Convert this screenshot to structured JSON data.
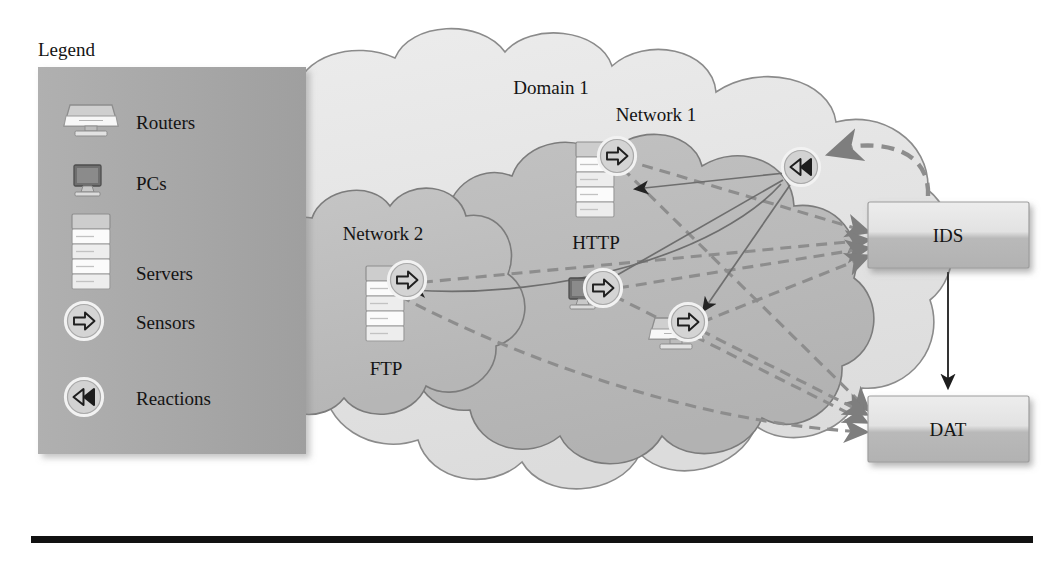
{
  "figure": {
    "background_color": "#ffffff",
    "rule_color": "#111111"
  },
  "legend": {
    "title": "Legend",
    "panel_color": "#a9a9a9",
    "items": [
      {
        "icon": "router-icon",
        "label": "Routers"
      },
      {
        "icon": "pc-icon",
        "label": "PCs"
      },
      {
        "icon": "server-icon",
        "label": "Servers"
      },
      {
        "icon": "sensor-icon",
        "label": "Sensors"
      },
      {
        "icon": "reaction-icon",
        "label": "Reactions"
      }
    ]
  },
  "clouds": [
    {
      "id": "domain1",
      "label": "Domain 1",
      "fill": "#e6e6e6",
      "stroke": "#8a8a8a"
    },
    {
      "id": "network1",
      "label": "Network 1",
      "fill": "#b9b9b9",
      "stroke": "#7d7d7d"
    },
    {
      "id": "network2",
      "label": "Network 2",
      "fill": "#bdbdbd",
      "stroke": "#7d7d7d"
    }
  ],
  "nodes": [
    {
      "id": "http",
      "label": "HTTP",
      "type": "server-icon",
      "sensor": true,
      "network": "Network 1"
    },
    {
      "id": "ftp",
      "label": "FTP",
      "type": "server-icon",
      "sensor": true,
      "network": "Network 2"
    },
    {
      "id": "pc1",
      "label": "",
      "type": "pc-icon",
      "sensor": true,
      "network": "Network 1"
    },
    {
      "id": "rtr1",
      "label": "",
      "type": "router-icon",
      "sensor": true,
      "network": "Network 1"
    },
    {
      "id": "rx1",
      "label": "",
      "type": "reaction-icon",
      "sensor": false,
      "network": "Network 1"
    }
  ],
  "boxes": [
    {
      "id": "ids",
      "label": "IDS",
      "fill_top": "#e9e9e9",
      "fill_bottom": "#b6b6b6",
      "stroke": "#9a9a9a"
    },
    {
      "id": "dat",
      "label": "DAT",
      "fill_top": "#e9e9e9",
      "fill_bottom": "#b6b6b6",
      "stroke": "#9a9a9a"
    }
  ],
  "edges": {
    "alert_style": "dashed",
    "alert_color": "#8d8d8d",
    "reaction_style": "solid",
    "reaction_color": "#6b6b6b",
    "ids_to_dat_color": "#2b2b2b",
    "alerts": [
      {
        "from": "http",
        "to": "ids"
      },
      {
        "from": "http",
        "to": "dat"
      },
      {
        "from": "ftp",
        "to": "ids"
      },
      {
        "from": "ftp",
        "to": "dat"
      },
      {
        "from": "pc1",
        "to": "ids"
      },
      {
        "from": "pc1",
        "to": "dat"
      },
      {
        "from": "rtr1",
        "to": "ids"
      },
      {
        "from": "rtr1",
        "to": "dat"
      },
      {
        "from": "ids",
        "to": "rx1"
      }
    ],
    "reactions": [
      {
        "from": "rx1",
        "to": "http"
      },
      {
        "from": "rx1",
        "to": "ftp"
      },
      {
        "from": "rx1",
        "to": "pc1"
      },
      {
        "from": "rx1",
        "to": "rtr1"
      }
    ],
    "control": [
      {
        "from": "ids",
        "to": "dat"
      }
    ]
  }
}
